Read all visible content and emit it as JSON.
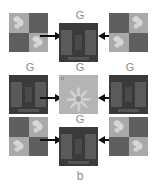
{
  "figure": {
    "panel_letter": "b",
    "cropped_header_text": "",
    "state_label": "G",
    "rows": [
      {
        "row_id": "top",
        "left_cell": {
          "label": "",
          "tile_type": "quadrant",
          "quadrants": [
            "light",
            "dark",
            "dark",
            "light"
          ],
          "arrow": "arrow-right"
        },
        "center_cell": {
          "label": "G",
          "tile_type": "beam"
        },
        "right_cell": {
          "label": "",
          "tile_type": "quadrant",
          "quadrants": [
            "dark",
            "light",
            "light",
            "dark"
          ],
          "arrow": "arrow-left"
        }
      },
      {
        "row_id": "middle",
        "left_cell": {
          "label": "G",
          "tile_type": "beam",
          "arrow": "arrow-right"
        },
        "center_cell": {
          "label": "G",
          "tile_type": "flower"
        },
        "right_cell": {
          "label": "G",
          "tile_type": "beam",
          "arrow": "arrow-left"
        }
      },
      {
        "row_id": "bottom",
        "left_cell": {
          "label": "",
          "tile_type": "quadrant",
          "quadrants": [
            "dark",
            "light",
            "light",
            "dark"
          ],
          "arrow": "arrow-right"
        },
        "center_cell": {
          "label": "G",
          "tile_type": "beam"
        },
        "right_cell": {
          "label": "",
          "tile_type": "quadrant",
          "quadrants": [
            "light",
            "dark",
            "dark",
            "light"
          ],
          "arrow": "arrow-left"
        }
      }
    ],
    "colors": {
      "background": "#ffffff",
      "label_text": "#8b8b8b",
      "arrow": "#111111",
      "tile_dark_quadrant": "#5f5f5f",
      "tile_light_quadrant": "#a9a9a9",
      "tile_blob": "#d6d6d6",
      "beam_background": "#3a3a3a",
      "beam_bar": "#5a5a5a",
      "flower_background": "#b4b4b4",
      "flower_petal": "#cfcfcf"
    }
  }
}
